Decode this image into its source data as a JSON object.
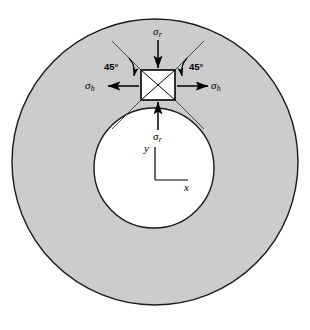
{
  "figure": {
    "colors": {
      "annulus_fill": "#cccccc",
      "bore_fill": "#ffffff",
      "outline": "#1a1a1a",
      "background": "#ffffff"
    },
    "geometry": {
      "outer_circle": {
        "cx": 155,
        "cy": 162,
        "r": 143
      },
      "inner_circle": {
        "cx": 154,
        "cy": 168,
        "r": 60
      },
      "stress_element_square": {
        "x": 141,
        "y": 70,
        "width": 34,
        "height": 30
      }
    },
    "labels": {
      "sigma_r_top": {
        "symbol": "σ",
        "subscript": "r"
      },
      "sigma_r_bottom": {
        "symbol": "σ",
        "subscript": "r"
      },
      "sigma_h_left": {
        "symbol": "σ",
        "subscript": "h"
      },
      "sigma_h_right": {
        "symbol": "σ",
        "subscript": "h"
      },
      "angle_left": "45°",
      "angle_right": "45°",
      "axis_x": "x",
      "axis_y": "y"
    }
  }
}
